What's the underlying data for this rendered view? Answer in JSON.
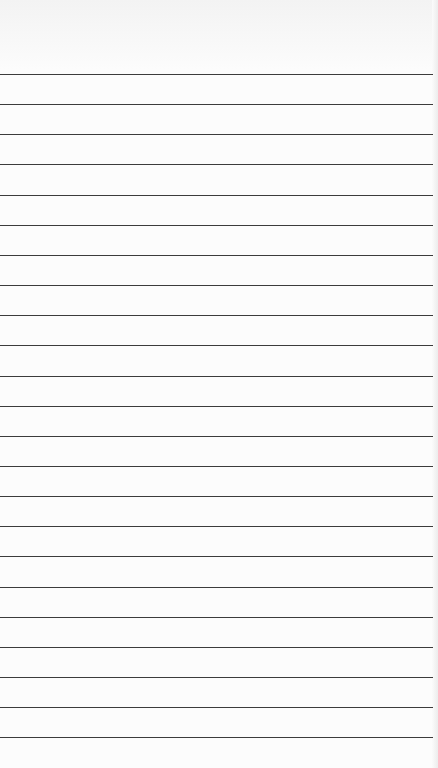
{
  "page": {
    "type": "lined-notepad",
    "background_color": "#fbfbfb",
    "line_color": "#3c3c3c",
    "first_line_y": 74,
    "line_spacing": 30.15,
    "line_count": 23
  }
}
